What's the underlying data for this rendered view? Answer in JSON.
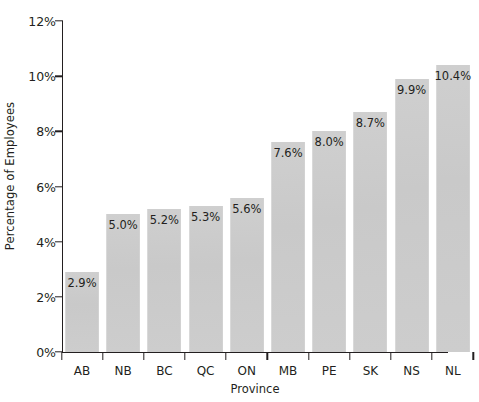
{
  "chart_data": {
    "type": "bar",
    "title": "",
    "xlabel": "Province",
    "ylabel": "Percentage of Employees",
    "categories": [
      "AB",
      "NB",
      "BC",
      "QC",
      "ON",
      "MB",
      "PE",
      "SK",
      "NS",
      "NL"
    ],
    "values": [
      2.9,
      5.0,
      5.2,
      5.3,
      5.6,
      7.6,
      8.0,
      8.7,
      9.9,
      10.4
    ],
    "value_labels": [
      "2.9%",
      "5.0%",
      "5.2%",
      "5.3%",
      "5.6%",
      "7.6%",
      "8.0%",
      "8.7%",
      "9.9%",
      "10.4%"
    ],
    "ylim": [
      0,
      12
    ],
    "ytick_values": [
      0,
      2,
      4,
      6,
      8,
      10,
      12
    ],
    "ytick_labels": [
      "0%",
      "2%",
      "4%",
      "6%",
      "8%",
      "10%",
      "12%"
    ],
    "grid": false,
    "legend": false,
    "bar_color": "#cccccc",
    "axis_color": "#231f20",
    "background": "#ffffff"
  }
}
